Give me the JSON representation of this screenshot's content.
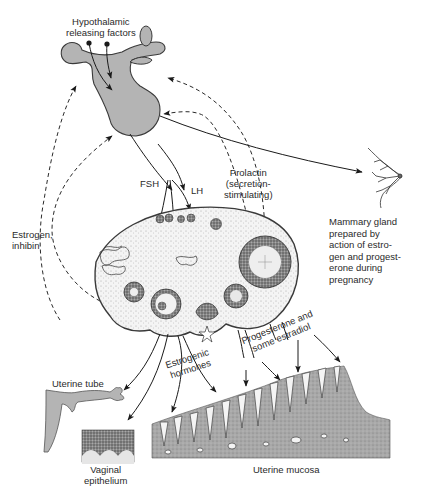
{
  "labels": {
    "hypothalamic": [
      "Hypothalamic",
      "releasing factors"
    ],
    "fsh": "FSH",
    "lh": "LH",
    "prolactin": [
      "Prolactin",
      "(secretion-",
      "stimulating)"
    ],
    "mammary": [
      "Mammary gland",
      "prepared by",
      "action of estro-",
      "gen and progest-",
      "erone during",
      "pregnancy"
    ],
    "estrogen_inhibin": [
      "Estrogen,",
      "inhibin"
    ],
    "progesterone": [
      "Progesterone and",
      "some estradiol"
    ],
    "estrogenic": [
      "Estrogenic",
      "hormones"
    ],
    "uterine_tube": "Uterine tube",
    "vaginal": [
      "Vaginal",
      "epithelium"
    ],
    "uterine_mucosa": "Uterine mucosa"
  },
  "structures": {
    "pituitary": "pituitary-gland",
    "ovary": "ovary",
    "breast": "mammary-gland",
    "uterine_tube": "uterine-tube",
    "vaginal_epithelium": "vaginal-epithelium",
    "uterine_mucosa": "uterine-mucosa"
  },
  "colors": {
    "gland_fill": "#b4b4b4",
    "outline": "#3a3a3a",
    "tissue_fill": "#c8c8c8",
    "tissue_dark": "#7a7a7a",
    "text": "#2a2a2a",
    "background": "#ffffff"
  }
}
